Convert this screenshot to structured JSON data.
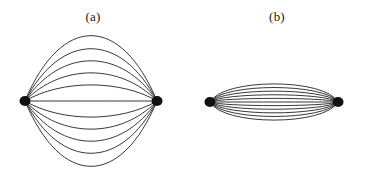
{
  "figure": {
    "background_color": "#ffffff",
    "ink_color": "#222222",
    "vertex_color": "#111111",
    "width": 373,
    "height": 172,
    "panels": [
      {
        "id": "panel-a",
        "label": "(a)",
        "label_x": 93,
        "label_y": 17,
        "description": "dipole multigraph drawn as a wide lens / eye shape",
        "edge_count": 11,
        "left_vertex": {
          "x": 25,
          "y": 101,
          "rx": 5.5,
          "ry": 5.0
        },
        "right_vertex": {
          "x": 157,
          "y": 101,
          "rx": 5.5,
          "ry": 5.0
        },
        "max_bulge": 65,
        "stroke_width": 0.9,
        "shape": "lens"
      },
      {
        "id": "panel-b",
        "label": "(b)",
        "label_x": 277,
        "label_y": 17,
        "description": "same dipole multigraph flattened into an elongated stadium / capsule shape",
        "edge_count": 11,
        "left_vertex": {
          "x": 210,
          "y": 102,
          "rx": 5.5,
          "ry": 5.0
        },
        "right_vertex": {
          "x": 338,
          "y": 102,
          "rx": 5.5,
          "ry": 5.0
        },
        "max_bulge": 18,
        "flatness": 0.82,
        "stroke_width": 0.9,
        "shape": "stadium"
      }
    ]
  },
  "chart_data": {
    "type": "diagram",
    "title": "",
    "subtitle": "",
    "panels": [
      {
        "label": "(a)",
        "graph_type": "dipole-multigraph",
        "vertices": 2,
        "edges": 11,
        "layout": "lens",
        "bulges": [
          -65,
          -52,
          -40,
          -28,
          -16,
          0,
          16,
          28,
          40,
          52,
          65
        ]
      },
      {
        "label": "(b)",
        "graph_type": "dipole-multigraph",
        "vertices": 2,
        "edges": 11,
        "layout": "stadium",
        "bulges": [
          -18,
          -14.4,
          -10.8,
          -7.2,
          -3.6,
          0,
          3.6,
          7.2,
          10.8,
          14.4,
          18
        ]
      }
    ],
    "xlabel": "",
    "ylabel": "",
    "legend": []
  }
}
